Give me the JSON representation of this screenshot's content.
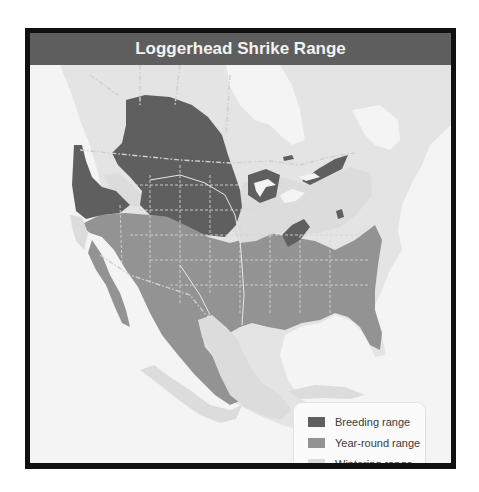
{
  "map": {
    "title": "Loggerhead Shrike Range",
    "legend": [
      {
        "label": "Breeding range",
        "color": "#5f5f5f"
      },
      {
        "label": "Year-round range",
        "color": "#939393"
      },
      {
        "label": "Wintering range",
        "color": "#dcdcdc"
      }
    ],
    "colors": {
      "land": "#e4e4e4",
      "water": "#f4f4f4",
      "border_line": "#c8c8c8"
    }
  }
}
